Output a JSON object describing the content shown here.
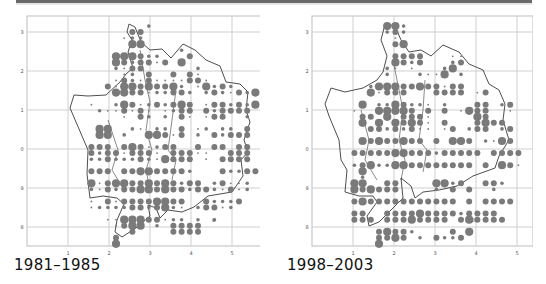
{
  "figure": {
    "type": "dot-distribution-map",
    "colors": {
      "dot": "#7a7a7a",
      "outline": "#3a3a3a",
      "grid": "#cfcfcf",
      "frame": "#bdbdbd",
      "tick_label": "#555555"
    }
  },
  "axes": {
    "x_ticks": [
      "1",
      "2",
      "3",
      "4",
      "5"
    ],
    "y_ticks": [
      "3",
      "2",
      "1",
      "0",
      "9",
      "8"
    ]
  },
  "panels": [
    {
      "caption": "1981–1985",
      "annotation": "Ø",
      "dots": [
        "0000000000000000000000000000",
        "0000000000000020000000000000",
        "0000000000003300000000000000",
        "0000000000012200000000000000",
        "0000000000004400000000000000",
        "0000000000000000002000000000",
        "0000000000444322000300000000",
        "0000000000432331304000000000",
        "0000000000213300000020000000",
        "0000000000012030030310000000",
        "0000000000132131111331000000",
        "0000000003144343342014232000",
        "0000000000443312233202321324",
        "0000000000000000000000000000",
        "0000000100243123234301332324",
        "0000000021131310123303233330",
        "0000000000010320203101330020",
        "0000000000000000000000000000",
        "0000000044002102203012022030",
        "0000000044020044313020323330",
        "0000000000000000000000000000",
        "0000000333034312330030330330",
        "0000000323313331033311003330",
        "0000000223222321433301033330",
        "0000000000000000000000000000",
        "0000000333033443333200032233",
        "0000000000000000000000000000",
        "0000000413443343432330231120",
        "0000000213233443433233213120",
        "0000000000000000000000000000",
        "0000000103133334433003222300",
        "0000000122223323421023312000",
        "0000000000000000000000000000",
        "0000000001144433122020200000",
        "0000000000134402033330000000",
        "0000000000003000033330000000",
        "0000000000300000000000000000",
        "0000000000400000000000000000",
        "0000000000000000000000000000"
      ]
    },
    {
      "caption": "1998–2003",
      "annotation": "Ø",
      "dots": [
        "0000000000000000000000000000",
        "0000000000044200000000000000",
        "0000000000023200000000000000",
        "0000000000001000000000000000",
        "0000000000003400000000000000",
        "0000000000000000000000000000",
        "0000000000003333000110000000",
        "0000000000004323000230000000",
        "0000000000021010002400000000",
        "0000000000020002114020000000",
        "0000000000000000000000000000",
        "0000000002444334331330000000",
        "0000000004133300033330130000",
        "0000000000000000000000000000",
        "0000000040224322102000330230",
        "0000000100444430303014330010",
        "0000000033040333100000430000",
        "0000000040404343103000343300",
        "0000000003323231101302330230",
        "0000000000000000000000000000",
        "0000000043433433030443021430",
        "0000000000000000000000000000",
        "0000000333334433323333303333",
        "0000000000000000000000000000",
        "0000000234224433333333030431",
        "0000000040000000000000000000",
        "0000000020000000000000000000",
        "0000000440033000044230033200",
        "0000000434333000020303002000",
        "0000000000000000000000000000",
        "0000000343333333333303033330",
        "0000000000000000000000000000",
        "0000000330033334333323333000",
        "0000000333033343333034333300",
        "0000000000000000000000000000",
        "0000000000343320000304000000",
        "0000000000334302032230000000",
        "0000000000400000000000000000",
        "0000000000000000000000000000"
      ]
    }
  ]
}
